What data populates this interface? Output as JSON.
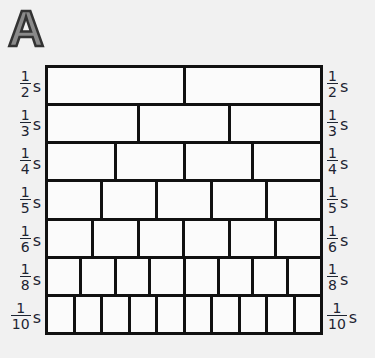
{
  "panel": {
    "letter": "A"
  },
  "colors": {
    "grid_line": "#111111",
    "cell_fill": "#fbfbfb",
    "background": "#f1f1f1",
    "label": "#1d2431",
    "letter_fill": "#8a8a8a"
  },
  "rows": [
    {
      "numerator": "1",
      "denominator": "2",
      "unit": "s",
      "cells": 2
    },
    {
      "numerator": "1",
      "denominator": "3",
      "unit": "s",
      "cells": 3
    },
    {
      "numerator": "1",
      "denominator": "4",
      "unit": "s",
      "cells": 4
    },
    {
      "numerator": "1",
      "denominator": "5",
      "unit": "s",
      "cells": 5
    },
    {
      "numerator": "1",
      "denominator": "6",
      "unit": "s",
      "cells": 6
    },
    {
      "numerator": "1",
      "denominator": "8",
      "unit": "s",
      "cells": 8
    },
    {
      "numerator": "1",
      "denominator": "10",
      "unit": "s",
      "cells": 10
    }
  ]
}
